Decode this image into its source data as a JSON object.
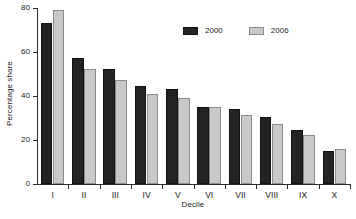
{
  "chart_data": {
    "type": "bar",
    "title": "",
    "subtitle": "",
    "xlabel": "Decile",
    "ylabel": "Percentage share",
    "categories": [
      "I",
      "II",
      "III",
      "IV",
      "V",
      "VI",
      "VII",
      "VIII",
      "IX",
      "X"
    ],
    "series": [
      {
        "name": "2000",
        "color": "#232323",
        "values": [
          73,
          57.5,
          52.5,
          44.5,
          43,
          35,
          34,
          30.5,
          24.5,
          15
        ]
      },
      {
        "name": "2006",
        "color": "#c9c9c9",
        "values": [
          79,
          52.5,
          47.5,
          41,
          39,
          35,
          31.5,
          27.5,
          22.5,
          16
        ]
      }
    ],
    "ylim": [
      0,
      80
    ],
    "yticks": [
      0,
      20,
      40,
      60,
      80
    ],
    "ytick_labels": [
      "0",
      "20",
      "40",
      "60",
      "80"
    ],
    "grid": false,
    "legend_position": "top-center"
  }
}
